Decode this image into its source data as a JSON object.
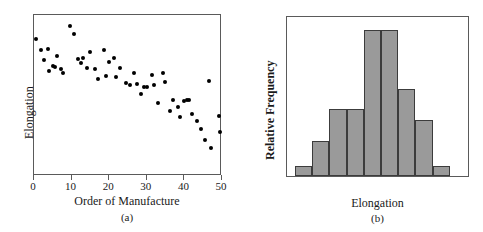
{
  "figure": {
    "panels": [
      {
        "caption": "(a)",
        "xlabel": "Order of Manufacture",
        "ylabel": "Elongation"
      },
      {
        "caption": "(b)",
        "xlabel": "Elongation",
        "ylabel": "Relative Frequency"
      }
    ]
  },
  "chart_data": [
    {
      "type": "scatter",
      "title": "",
      "xlabel": "Order of Manufacture",
      "ylabel": "Elongation",
      "caption": "(a)",
      "xlim": [
        0,
        50
      ],
      "ylim": [
        0,
        100
      ],
      "xticks": [
        0,
        10,
        20,
        30,
        40,
        50
      ],
      "xticklabels": [
        "0",
        "10",
        "20",
        "30",
        "40",
        "50"
      ],
      "yticks": [],
      "yticklabels": [],
      "grid": false,
      "legend": false,
      "marker": "filled-circle",
      "marker_color": "#000000",
      "points": [
        {
          "x": 0.6,
          "y": 85.0
        },
        {
          "x": 1.8,
          "y": 78.5
        },
        {
          "x": 2.6,
          "y": 72.0
        },
        {
          "x": 3.6,
          "y": 79.0
        },
        {
          "x": 3.9,
          "y": 65.5
        },
        {
          "x": 5.0,
          "y": 68.5
        },
        {
          "x": 5.6,
          "y": 68.0
        },
        {
          "x": 6.2,
          "y": 74.5
        },
        {
          "x": 7.1,
          "y": 66.5
        },
        {
          "x": 7.6,
          "y": 64.0
        },
        {
          "x": 9.6,
          "y": 93.0
        },
        {
          "x": 10.6,
          "y": 88.0
        },
        {
          "x": 11.8,
          "y": 72.5
        },
        {
          "x": 12.4,
          "y": 70.0
        },
        {
          "x": 13.1,
          "y": 73.5
        },
        {
          "x": 14.2,
          "y": 67.0
        },
        {
          "x": 15.0,
          "y": 77.0
        },
        {
          "x": 16.2,
          "y": 66.5
        },
        {
          "x": 17.0,
          "y": 60.0
        },
        {
          "x": 18.6,
          "y": 78.0
        },
        {
          "x": 19.2,
          "y": 62.0
        },
        {
          "x": 20.0,
          "y": 71.0
        },
        {
          "x": 21.3,
          "y": 73.0
        },
        {
          "x": 21.9,
          "y": 61.5
        },
        {
          "x": 23.0,
          "y": 67.0
        },
        {
          "x": 24.6,
          "y": 57.5
        },
        {
          "x": 25.6,
          "y": 56.5
        },
        {
          "x": 26.6,
          "y": 64.0
        },
        {
          "x": 27.4,
          "y": 57.0
        },
        {
          "x": 28.4,
          "y": 51.0
        },
        {
          "x": 29.2,
          "y": 55.5
        },
        {
          "x": 30.1,
          "y": 55.0
        },
        {
          "x": 31.3,
          "y": 63.0
        },
        {
          "x": 31.9,
          "y": 56.5
        },
        {
          "x": 33.0,
          "y": 45.5
        },
        {
          "x": 34.3,
          "y": 64.0
        },
        {
          "x": 34.9,
          "y": 58.5
        },
        {
          "x": 36.2,
          "y": 40.5
        },
        {
          "x": 37.0,
          "y": 47.0
        },
        {
          "x": 38.2,
          "y": 43.0
        },
        {
          "x": 38.9,
          "y": 36.5
        },
        {
          "x": 39.9,
          "y": 46.5
        },
        {
          "x": 40.6,
          "y": 47.0
        },
        {
          "x": 41.1,
          "y": 47.0
        },
        {
          "x": 42.1,
          "y": 38.5
        },
        {
          "x": 43.3,
          "y": 34.0
        },
        {
          "x": 44.5,
          "y": 29.0
        },
        {
          "x": 45.4,
          "y": 22.5
        },
        {
          "x": 46.6,
          "y": 59.0
        },
        {
          "x": 47.0,
          "y": 17.5
        },
        {
          "x": 49.2,
          "y": 37.0
        },
        {
          "x": 49.6,
          "y": 27.5
        }
      ]
    },
    {
      "type": "bar",
      "subtype": "histogram",
      "title": "",
      "xlabel": "Elongation",
      "ylabel": "Relative Frequency",
      "caption": "(b)",
      "categories": [
        "1",
        "2",
        "3",
        "4",
        "5",
        "6",
        "7",
        "8",
        "9"
      ],
      "values": [
        6,
        22,
        42,
        42,
        92,
        92,
        55,
        35,
        6
      ],
      "ylim": [
        0,
        100
      ],
      "xticks": [],
      "xticklabels": [],
      "yticks": [],
      "yticklabels": [],
      "grid": false,
      "legend": false,
      "bar_fill": "#9a9a9a",
      "bar_edge": "#3c3c3c"
    }
  ]
}
